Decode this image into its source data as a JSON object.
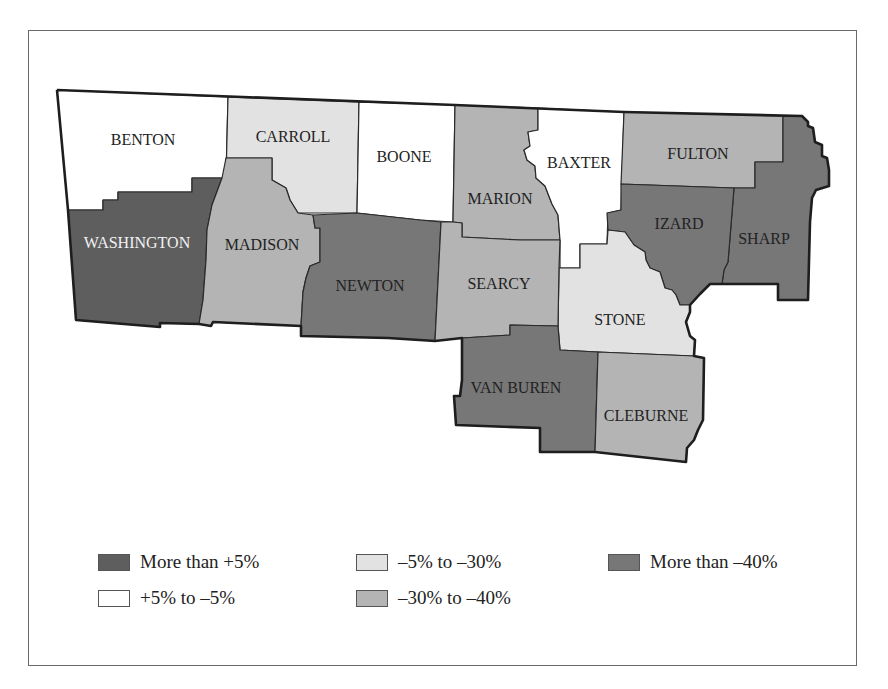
{
  "map": {
    "counties": [
      {
        "name": "BENTON",
        "category": "+5% to -5%"
      },
      {
        "name": "CARROLL",
        "category": "-5% to -30%"
      },
      {
        "name": "BOONE",
        "category": "+5% to -5%"
      },
      {
        "name": "MARION",
        "category": "-30% to -40%"
      },
      {
        "name": "BAXTER",
        "category": "+5% to -5%"
      },
      {
        "name": "FULTON",
        "category": "-30% to -40%"
      },
      {
        "name": "WASHINGTON",
        "category": "More than +5%"
      },
      {
        "name": "MADISON",
        "category": "-30% to -40%"
      },
      {
        "name": "NEWTON",
        "category": "More than -40%"
      },
      {
        "name": "SEARCY",
        "category": "-30% to -40%"
      },
      {
        "name": "IZARD",
        "category": "More than -40%"
      },
      {
        "name": "SHARP",
        "category": "More than -40%"
      },
      {
        "name": "STONE",
        "category": "-5% to -30%"
      },
      {
        "name": "VAN BUREN",
        "category": "More than -40%"
      },
      {
        "name": "CLEBURNE",
        "category": "-30% to -40%"
      }
    ]
  },
  "legend": {
    "items": [
      {
        "label": "More than +5%",
        "color": "#5e5e5e"
      },
      {
        "label": "-5% to -30%",
        "color": "#e2e2e2"
      },
      {
        "label": "More than -40%",
        "color": "#777777"
      },
      {
        "label": "+5% to -5%",
        "color": "#ffffff"
      },
      {
        "label": "-30% to -40%",
        "color": "#b4b4b4"
      }
    ]
  },
  "labels": {
    "benton": "BENTON",
    "carroll": "CARROLL",
    "boone": "BOONE",
    "marion": "MARION",
    "baxter": "BAXTER",
    "fulton": "FULTON",
    "washington": "WASHINGTON",
    "madison": "MADISON",
    "newton": "NEWTON",
    "searcy": "SEARCY",
    "izard": "IZARD",
    "sharp": "SHARP",
    "stone": "STONE",
    "vanburen": "VAN BUREN",
    "cleburne": "CLEBURNE"
  },
  "legend_labels": {
    "l0": "More than +5%",
    "l1": "–5% to –30%",
    "l2": "More than –40%",
    "l3": "+5% to –5%",
    "l4": "–30% to –40%"
  }
}
